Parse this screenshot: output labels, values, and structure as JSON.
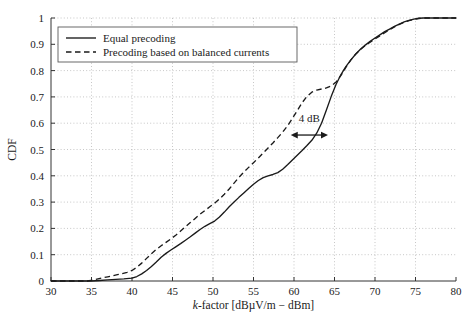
{
  "chart_data": {
    "type": "line",
    "title": "",
    "xlabel": "k-factor [dBµV/m − dBm]",
    "ylabel": "CDF",
    "xlim": [
      30,
      80
    ],
    "ylim": [
      0,
      1
    ],
    "grid": true,
    "legend_position": "top-left",
    "xticks": [
      30,
      35,
      40,
      45,
      50,
      55,
      60,
      65,
      70,
      75,
      80
    ],
    "xtick_labels": [
      "30",
      "35",
      "40",
      "45",
      "50",
      "55",
      "60",
      "65",
      "70",
      "75",
      "80"
    ],
    "yticks": [
      0,
      0.1,
      0.2,
      0.3,
      0.4,
      0.5,
      0.6,
      0.7,
      0.8,
      0.9,
      1
    ],
    "ytick_labels": [
      "0",
      "0.1",
      "0.2",
      "0.3",
      "0.4",
      "0.5",
      "0.6",
      "0.7",
      "0.8",
      "0.9",
      "1"
    ],
    "annotations": [
      {
        "text": "4 dB",
        "type": "double-arrow",
        "x_start": 59.6,
        "x_end": 64.2,
        "y": 0.555,
        "label_x": 61.9,
        "label_y": 0.605
      }
    ],
    "series": [
      {
        "name": "Equal precoding",
        "style": "solid",
        "x": [
          30,
          35,
          36,
          37,
          38,
          39,
          40,
          40.6,
          41.2,
          41.8,
          42.4,
          43,
          43.6,
          44.2,
          44.8,
          45.4,
          46,
          46.6,
          47.2,
          47.8,
          48.4,
          49,
          49.6,
          50.2,
          50.8,
          51.4,
          52,
          52.6,
          53.2,
          53.8,
          54.4,
          55,
          55.6,
          56.2,
          56.8,
          57.4,
          58,
          58.6,
          59.2,
          59.8,
          60.4,
          61,
          61.6,
          62.2,
          62.8,
          63.4,
          64,
          64.6,
          65.2,
          65.8,
          66.4,
          67,
          67.6,
          68.2,
          68.8,
          69.4,
          70,
          70.6,
          71.2,
          71.8,
          72.4,
          73,
          73.6,
          74.2,
          74.8,
          75.4,
          76,
          77,
          78,
          79,
          80
        ],
        "y": [
          0,
          0,
          0.002,
          0.004,
          0.006,
          0.008,
          0.011,
          0.017,
          0.027,
          0.04,
          0.055,
          0.072,
          0.09,
          0.105,
          0.118,
          0.13,
          0.142,
          0.155,
          0.168,
          0.182,
          0.196,
          0.208,
          0.218,
          0.228,
          0.243,
          0.262,
          0.282,
          0.3,
          0.318,
          0.335,
          0.352,
          0.368,
          0.382,
          0.393,
          0.4,
          0.405,
          0.412,
          0.425,
          0.442,
          0.46,
          0.478,
          0.496,
          0.515,
          0.535,
          0.562,
          0.6,
          0.65,
          0.702,
          0.748,
          0.785,
          0.815,
          0.84,
          0.862,
          0.881,
          0.897,
          0.911,
          0.924,
          0.936,
          0.948,
          0.958,
          0.968,
          0.977,
          0.985,
          0.991,
          0.996,
          0.999,
          1,
          1,
          1,
          1,
          1
        ]
      },
      {
        "name": "Precoding based on balanced currents",
        "style": "dashed",
        "x": [
          30,
          34.5,
          35.2,
          35.8,
          36.4,
          37,
          37.6,
          38.2,
          38.8,
          39.4,
          40,
          40.6,
          41.2,
          41.8,
          42.4,
          43,
          43.6,
          44.2,
          44.8,
          45.4,
          46,
          46.6,
          47.2,
          47.8,
          48.4,
          49,
          49.6,
          50.2,
          50.8,
          51.4,
          52,
          52.6,
          53.2,
          53.8,
          54.4,
          55,
          55.6,
          56.2,
          56.8,
          57.4,
          58,
          58.6,
          59.2,
          59.8,
          60.4,
          61,
          61.6,
          62.2,
          62.8,
          63.4,
          64,
          64.6,
          65.2,
          65.8,
          66.4,
          67,
          67.6,
          68.2,
          68.8,
          69.4,
          70,
          70.6,
          71.2,
          71.8,
          72.4,
          73,
          73.6,
          74.2,
          74.8,
          75.4,
          76,
          77,
          78,
          79,
          80
        ],
        "y": [
          0,
          0,
          0.004,
          0.008,
          0.012,
          0.016,
          0.02,
          0.024,
          0.028,
          0.033,
          0.04,
          0.052,
          0.068,
          0.086,
          0.104,
          0.12,
          0.134,
          0.147,
          0.16,
          0.174,
          0.19,
          0.206,
          0.222,
          0.238,
          0.254,
          0.268,
          0.282,
          0.296,
          0.312,
          0.33,
          0.35,
          0.372,
          0.394,
          0.414,
          0.432,
          0.45,
          0.468,
          0.487,
          0.506,
          0.525,
          0.545,
          0.566,
          0.59,
          0.618,
          0.648,
          0.678,
          0.702,
          0.718,
          0.726,
          0.73,
          0.734,
          0.742,
          0.757,
          0.782,
          0.812,
          0.84,
          0.862,
          0.88,
          0.895,
          0.908,
          0.92,
          0.932,
          0.944,
          0.955,
          0.966,
          0.976,
          0.984,
          0.99,
          0.995,
          0.998,
          1,
          1,
          1,
          1,
          1
        ]
      }
    ]
  }
}
